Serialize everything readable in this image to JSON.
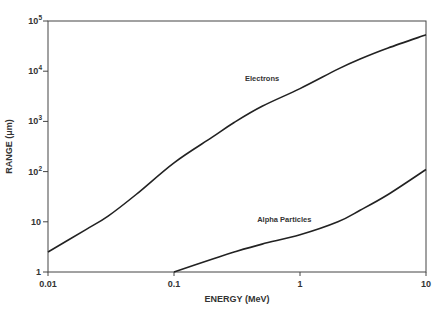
{
  "chart_data": {
    "type": "line",
    "title": "",
    "xlabel": "ENERGY (MeV)",
    "ylabel": "RANGE (μm)",
    "xscale": "log",
    "yscale": "log",
    "xlim": [
      0.01,
      10
    ],
    "ylim": [
      1,
      100000
    ],
    "grid": false,
    "legend": "inline labels",
    "x_ticks": [
      {
        "value": 0.01,
        "label": "0.01"
      },
      {
        "value": 0.1,
        "label": "0.1"
      },
      {
        "value": 1,
        "label": "1"
      },
      {
        "value": 10,
        "label": "10"
      }
    ],
    "y_ticks": [
      {
        "value": 1,
        "base": "1",
        "exp": ""
      },
      {
        "value": 10,
        "base": "10",
        "exp": ""
      },
      {
        "value": 100,
        "base": "10",
        "exp": "2"
      },
      {
        "value": 1000,
        "base": "10",
        "exp": "3"
      },
      {
        "value": 10000,
        "base": "10",
        "exp": "4"
      },
      {
        "value": 100000,
        "base": "10",
        "exp": "5"
      }
    ],
    "series": [
      {
        "name": "Electrons",
        "label_pos": {
          "energy": 0.5,
          "range": 6500
        },
        "x": [
          0.01,
          0.02,
          0.03,
          0.05,
          0.1,
          0.2,
          0.3,
          0.5,
          1,
          2,
          3,
          5,
          10
        ],
        "values": [
          2.5,
          7,
          13,
          35,
          150,
          480,
          950,
          2000,
          4500,
          11000,
          17500,
          29000,
          53000
        ]
      },
      {
        "name": "Alpha Particles",
        "label_pos": {
          "energy": 0.75,
          "range": 10
        },
        "x": [
          0.1,
          0.2,
          0.3,
          0.5,
          1,
          2,
          3,
          5,
          10
        ],
        "values": [
          1,
          1.8,
          2.5,
          3.6,
          5.5,
          10,
          17,
          35,
          110
        ]
      }
    ]
  }
}
